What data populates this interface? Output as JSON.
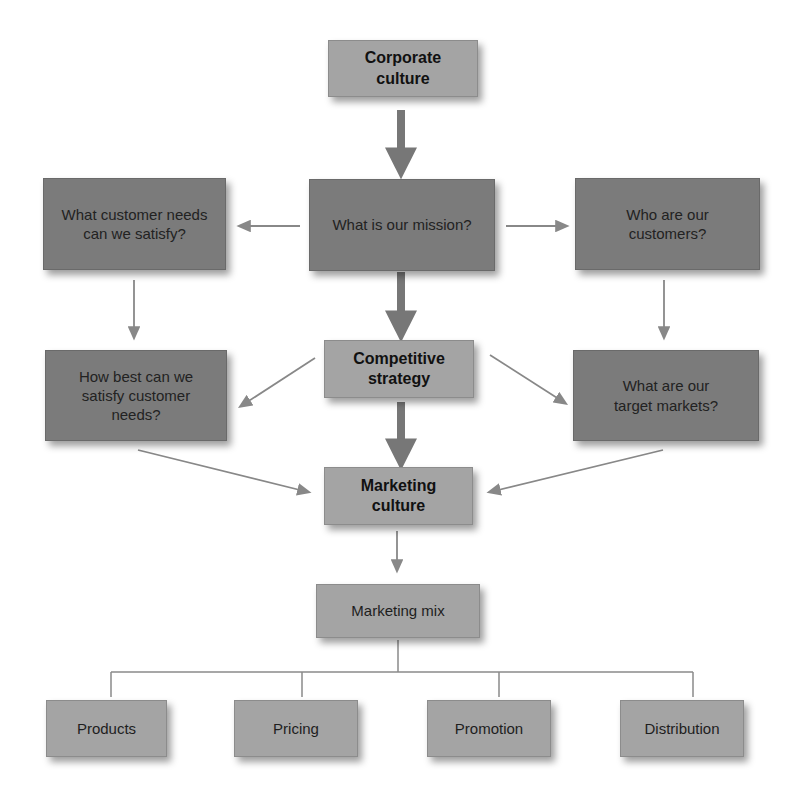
{
  "diagram": {
    "nodes": {
      "corporate_culture": "Corporate culture",
      "mission": "What is our mission?",
      "customer_needs": "What customer needs can we satisfy?",
      "customers": "Who are our customers?",
      "competitive_strategy": "Competitive strategy",
      "satisfy_needs": "How best can we satisfy customer needs?",
      "target_markets": "What are our target markets?",
      "marketing_culture": "Marketing culture",
      "marketing_mix": "Marketing mix",
      "products": "Products",
      "pricing": "Pricing",
      "promotion": "Promotion",
      "distribution": "Distribution"
    },
    "edges": [
      {
        "from": "corporate_culture",
        "to": "mission",
        "weight": "thick"
      },
      {
        "from": "mission",
        "to": "customer_needs",
        "weight": "thin"
      },
      {
        "from": "mission",
        "to": "customers",
        "weight": "thin"
      },
      {
        "from": "mission",
        "to": "competitive_strategy",
        "weight": "thick"
      },
      {
        "from": "customer_needs",
        "to": "satisfy_needs",
        "weight": "thin"
      },
      {
        "from": "customers",
        "to": "target_markets",
        "weight": "thin"
      },
      {
        "from": "competitive_strategy",
        "to": "satisfy_needs",
        "weight": "thin"
      },
      {
        "from": "competitive_strategy",
        "to": "target_markets",
        "weight": "thin"
      },
      {
        "from": "competitive_strategy",
        "to": "marketing_culture",
        "weight": "thick"
      },
      {
        "from": "satisfy_needs",
        "to": "marketing_culture",
        "weight": "thin"
      },
      {
        "from": "target_markets",
        "to": "marketing_culture",
        "weight": "thin"
      },
      {
        "from": "marketing_culture",
        "to": "marketing_mix",
        "weight": "thin"
      },
      {
        "from": "marketing_mix",
        "to": [
          "products",
          "pricing",
          "promotion",
          "distribution"
        ],
        "weight": "bracket"
      }
    ],
    "colors": {
      "dark_box": "#7b7b7b",
      "light_box": "#a4a4a4",
      "arrow": "#7a7a7a"
    }
  }
}
